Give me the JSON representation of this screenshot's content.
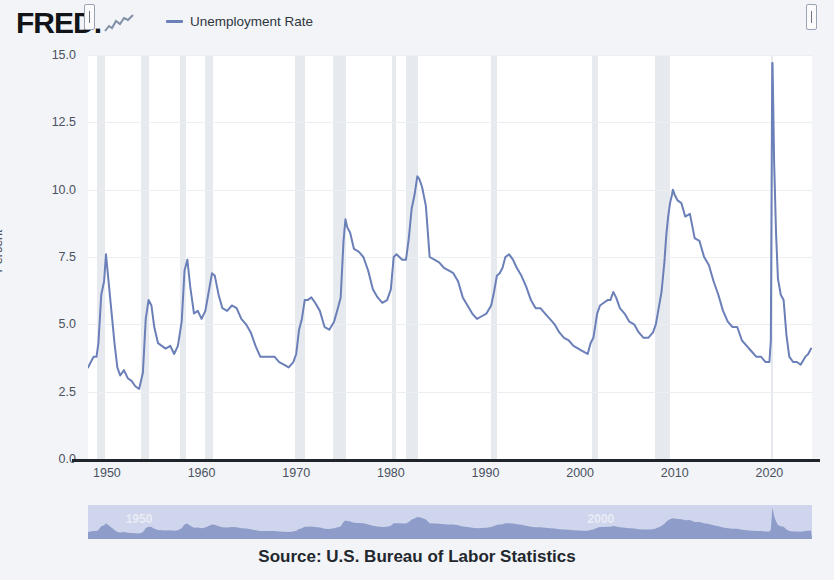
{
  "header": {
    "logo_text": "FRED",
    "logo_suffix": ".",
    "spark_icon": "sparkline-icon",
    "legend": {
      "swatch_color": "#6b7fb8",
      "label": "Unemployment Rate"
    }
  },
  "source": {
    "text": "Source: U.S. Bureau of Labor Statistics"
  },
  "navigator": {
    "left_handle_icon": "drag-handle-icon",
    "right_handle_icon": "drag-handle-icon",
    "year_labels": [
      {
        "text": "1950",
        "x_pct": 5.2
      },
      {
        "text": "2000",
        "x_pct": 69.0
      }
    ],
    "band_color": "#ced5ec",
    "area_color": "#8d9cc8"
  },
  "chart_data": {
    "type": "line",
    "title": "",
    "subtitle": "",
    "xlabel": "",
    "ylabel": "Percent",
    "xlim": [
      1948.0,
      2024.5
    ],
    "ylim": [
      0,
      15
    ],
    "grid": true,
    "legend_position": "top",
    "line_color": "#6b7fb8",
    "recession_band_color": "#e6e9ee",
    "y_ticks": [
      0.0,
      2.5,
      5.0,
      7.5,
      10.0,
      12.5,
      15.0
    ],
    "y_tick_labels": [
      "0.0",
      "2.5",
      "5.0",
      "7.5",
      "10.0",
      "12.5",
      "15.0"
    ],
    "x_ticks": [
      1950,
      1960,
      1970,
      1980,
      1990,
      2000,
      2010,
      2020
    ],
    "x_tick_labels": [
      "1950",
      "1960",
      "1970",
      "1980",
      "1990",
      "2000",
      "2010",
      "2020"
    ],
    "recessions": [
      {
        "start": 1948.92,
        "end": 1949.83
      },
      {
        "start": 1953.58,
        "end": 1954.42
      },
      {
        "start": 1957.67,
        "end": 1958.33
      },
      {
        "start": 1960.33,
        "end": 1961.17
      },
      {
        "start": 1969.92,
        "end": 1970.92
      },
      {
        "start": 1973.92,
        "end": 1975.25
      },
      {
        "start": 1980.08,
        "end": 1980.58
      },
      {
        "start": 1981.58,
        "end": 1982.92
      },
      {
        "start": 1990.58,
        "end": 1991.25
      },
      {
        "start": 2001.25,
        "end": 2001.92
      },
      {
        "start": 2007.92,
        "end": 2009.5
      },
      {
        "start": 2020.17,
        "end": 2020.33
      }
    ],
    "series": [
      {
        "name": "Unemployment Rate",
        "units": "Percent",
        "x": [
          1948.0,
          1948.3,
          1948.6,
          1948.9,
          1949.1,
          1949.4,
          1949.7,
          1949.9,
          1950.2,
          1950.5,
          1950.8,
          1951.1,
          1951.4,
          1951.8,
          1952.2,
          1952.6,
          1953.0,
          1953.4,
          1953.8,
          1954.1,
          1954.4,
          1954.7,
          1955.0,
          1955.4,
          1955.8,
          1956.2,
          1956.7,
          1957.1,
          1957.5,
          1957.9,
          1958.2,
          1958.5,
          1958.8,
          1959.2,
          1959.6,
          1960.0,
          1960.4,
          1960.8,
          1961.1,
          1961.4,
          1961.8,
          1962.2,
          1962.7,
          1963.2,
          1963.7,
          1964.2,
          1964.7,
          1965.2,
          1965.7,
          1966.2,
          1966.7,
          1967.2,
          1967.7,
          1968.2,
          1968.7,
          1969.2,
          1969.7,
          1970.0,
          1970.3,
          1970.6,
          1970.9,
          1971.2,
          1971.6,
          1972.0,
          1972.5,
          1973.0,
          1973.5,
          1974.0,
          1974.4,
          1974.7,
          1975.0,
          1975.2,
          1975.4,
          1975.7,
          1976.1,
          1976.6,
          1977.1,
          1977.6,
          1978.1,
          1978.6,
          1979.1,
          1979.6,
          1980.0,
          1980.3,
          1980.6,
          1980.9,
          1981.2,
          1981.6,
          1981.9,
          1982.2,
          1982.5,
          1982.8,
          1983.0,
          1983.3,
          1983.7,
          1984.1,
          1984.6,
          1985.1,
          1985.6,
          1986.1,
          1986.6,
          1987.1,
          1987.6,
          1988.1,
          1988.6,
          1989.1,
          1989.6,
          1990.1,
          1990.6,
          1990.9,
          1991.2,
          1991.5,
          1991.8,
          1992.1,
          1992.5,
          1992.9,
          1993.3,
          1993.8,
          1994.3,
          1994.8,
          1995.3,
          1995.8,
          1996.3,
          1996.8,
          1997.3,
          1997.8,
          1998.3,
          1998.8,
          1999.3,
          1999.8,
          2000.3,
          2000.8,
          2001.1,
          2001.4,
          2001.8,
          2002.1,
          2002.5,
          2002.9,
          2003.2,
          2003.5,
          2003.8,
          2004.2,
          2004.7,
          2005.2,
          2005.7,
          2006.2,
          2006.7,
          2007.2,
          2007.7,
          2008.0,
          2008.3,
          2008.6,
          2008.9,
          2009.1,
          2009.3,
          2009.5,
          2009.7,
          2009.8,
          2010.0,
          2010.3,
          2010.7,
          2011.1,
          2011.6,
          2012.1,
          2012.6,
          2013.1,
          2013.6,
          2014.1,
          2014.6,
          2015.1,
          2015.6,
          2016.1,
          2016.6,
          2017.1,
          2017.6,
          2018.1,
          2018.6,
          2019.1,
          2019.6,
          2020.0,
          2020.15,
          2020.3,
          2020.33,
          2020.4,
          2020.5,
          2020.7,
          2020.9,
          2021.2,
          2021.5,
          2021.8,
          2022.1,
          2022.5,
          2022.9,
          2023.3,
          2023.8,
          2024.1,
          2024.4
        ],
        "y": [
          3.4,
          3.6,
          3.8,
          3.8,
          4.3,
          6.1,
          6.6,
          7.6,
          6.5,
          5.4,
          4.3,
          3.4,
          3.1,
          3.3,
          3.0,
          2.9,
          2.7,
          2.6,
          3.2,
          5.2,
          5.9,
          5.7,
          4.9,
          4.3,
          4.2,
          4.1,
          4.2,
          3.9,
          4.2,
          5.1,
          7.0,
          7.4,
          6.4,
          5.4,
          5.5,
          5.2,
          5.5,
          6.3,
          6.9,
          6.8,
          6.1,
          5.6,
          5.5,
          5.7,
          5.6,
          5.2,
          5.0,
          4.7,
          4.2,
          3.8,
          3.8,
          3.8,
          3.8,
          3.6,
          3.5,
          3.4,
          3.6,
          3.9,
          4.8,
          5.2,
          5.9,
          5.9,
          6.0,
          5.8,
          5.5,
          4.9,
          4.8,
          5.1,
          5.6,
          6.0,
          8.1,
          8.9,
          8.6,
          8.4,
          7.8,
          7.7,
          7.5,
          7.0,
          6.3,
          6.0,
          5.8,
          5.9,
          6.3,
          7.5,
          7.6,
          7.5,
          7.4,
          7.4,
          8.2,
          9.3,
          9.8,
          10.5,
          10.4,
          10.1,
          9.4,
          7.5,
          7.4,
          7.3,
          7.1,
          7.0,
          6.9,
          6.6,
          6.0,
          5.7,
          5.4,
          5.2,
          5.3,
          5.4,
          5.7,
          6.2,
          6.8,
          6.9,
          7.1,
          7.5,
          7.6,
          7.4,
          7.1,
          6.8,
          6.4,
          5.9,
          5.6,
          5.6,
          5.4,
          5.2,
          5.0,
          4.7,
          4.5,
          4.4,
          4.2,
          4.1,
          4.0,
          3.9,
          4.3,
          4.5,
          5.4,
          5.7,
          5.8,
          5.9,
          5.9,
          6.2,
          6.0,
          5.6,
          5.4,
          5.1,
          5.0,
          4.7,
          4.5,
          4.5,
          4.7,
          5.0,
          5.6,
          6.2,
          7.3,
          8.3,
          9.0,
          9.5,
          9.8,
          10.0,
          9.8,
          9.6,
          9.5,
          9.0,
          9.1,
          8.2,
          8.1,
          7.5,
          7.2,
          6.6,
          6.1,
          5.5,
          5.1,
          4.9,
          4.9,
          4.4,
          4.2,
          4.0,
          3.8,
          3.8,
          3.6,
          3.6,
          4.4,
          14.7,
          14.7,
          13.2,
          11.0,
          8.4,
          6.7,
          6.1,
          5.9,
          4.6,
          3.8,
          3.6,
          3.6,
          3.5,
          3.8,
          3.9,
          4.1
        ]
      }
    ]
  }
}
